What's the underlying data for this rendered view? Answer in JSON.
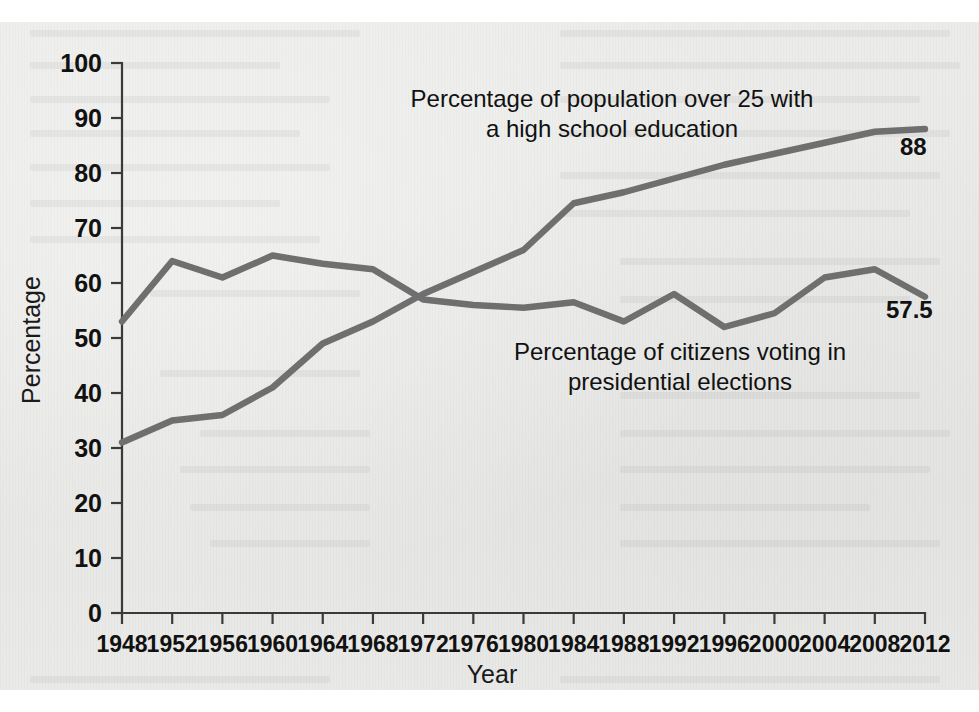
{
  "figure": {
    "background_color": "#e9e9e7",
    "line_color": "#6f6f6f",
    "axis_color": "#3a3a3a",
    "text_color": "#111111"
  },
  "axes": {
    "x_title": "Year",
    "y_title": "Percentage"
  },
  "labels": {
    "education_annotation_line1": "Percentage of population over 25 with",
    "education_annotation_line2": "a high school education",
    "voting_annotation_line1": "Percentage of citizens voting in",
    "voting_annotation_line2": "presidential elections",
    "education_endpoint": "88",
    "voting_endpoint": "57.5"
  },
  "chart_data": {
    "type": "line",
    "title": "",
    "xlabel": "Year",
    "ylabel": "Percentage",
    "xlim": [
      1948,
      2012
    ],
    "ylim": [
      0,
      100
    ],
    "grid": false,
    "legend_position": "inline-annotation",
    "x": [
      1948,
      1952,
      1956,
      1960,
      1964,
      1968,
      1972,
      1976,
      1980,
      1984,
      1988,
      1992,
      1996,
      2000,
      2004,
      2008,
      2012
    ],
    "x_tick_labels": [
      "1948",
      "1952",
      "1956",
      "1960",
      "1964",
      "1968",
      "1972",
      "1976",
      "1980",
      "1984",
      "1988",
      "1992",
      "1996",
      "2000",
      "2004",
      "2008",
      "2012"
    ],
    "y_tick_values": [
      0,
      10,
      20,
      30,
      40,
      50,
      60,
      70,
      80,
      90,
      100
    ],
    "y_tick_labels": [
      "0",
      "10",
      "20",
      "30",
      "40",
      "50",
      "60",
      "70",
      "80",
      "90",
      "100"
    ],
    "series": [
      {
        "name": "Percentage of population over 25 with a high school education",
        "color": "#6f6f6f",
        "values": [
          31,
          35,
          36,
          41,
          49,
          53,
          58,
          62,
          66,
          74.5,
          76.5,
          79,
          81.5,
          83.5,
          85.5,
          87.5,
          88
        ],
        "end_label": "88"
      },
      {
        "name": "Percentage of citizens voting in presidential elections",
        "color": "#6f6f6f",
        "values": [
          53,
          64,
          61,
          65,
          63.5,
          62.5,
          57,
          56,
          55.5,
          56.5,
          53,
          58,
          52,
          54.5,
          61,
          62.5,
          57.5
        ],
        "end_label": "57.5"
      }
    ],
    "annotations": [
      {
        "text": "Percentage of population over 25 with a high school education",
        "x": 1988,
        "y": 93
      },
      {
        "text": "Percentage of citizens voting in presidential elections",
        "x": 1992,
        "y": 47
      }
    ]
  }
}
